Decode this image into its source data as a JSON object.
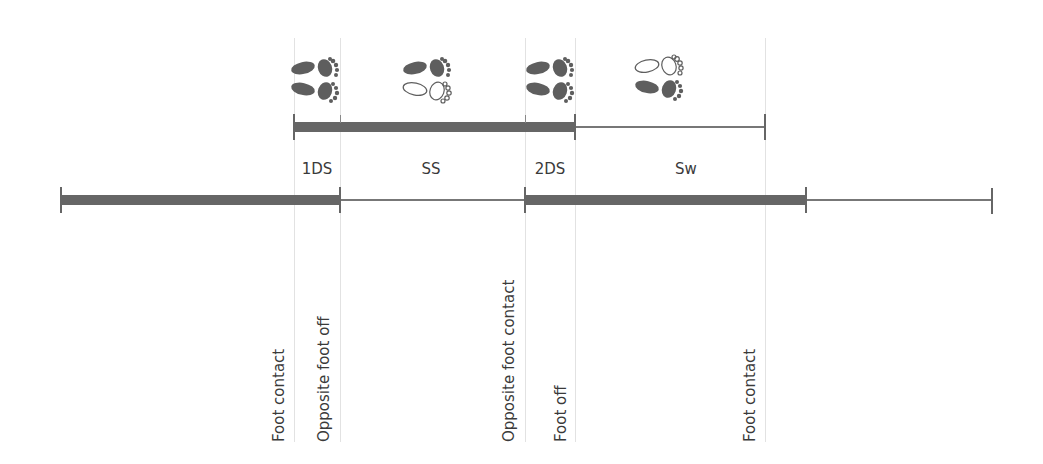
{
  "diagram": {
    "colors": {
      "bar_dark": "#666666",
      "bar_thin": "#777777",
      "guide": "#e2e2e2",
      "foot_filled": "#5e5e5e",
      "text": "#3a3a3a"
    },
    "phases": [
      {
        "id": "1ds",
        "label": "1DS",
        "feet": {
          "top": "filled",
          "bottom": "filled"
        }
      },
      {
        "id": "ss",
        "label": "SS",
        "feet": {
          "top": "filled",
          "bottom": "outline"
        }
      },
      {
        "id": "2ds",
        "label": "2DS",
        "feet": {
          "top": "filled",
          "bottom": "filled"
        }
      },
      {
        "id": "sw",
        "label": "Sw",
        "feet": {
          "top": "outline",
          "bottom": "filled"
        }
      }
    ],
    "events": [
      {
        "id": "foot-contact-1",
        "label": "Foot contact"
      },
      {
        "id": "opposite-foot-off",
        "label": "Opposite foot off"
      },
      {
        "id": "opposite-foot-contact",
        "label": "Opposite foot contact"
      },
      {
        "id": "foot-off",
        "label": "Foot off"
      },
      {
        "id": "foot-contact-2",
        "label": "Foot contact"
      }
    ],
    "icons": {
      "footprint_pair": "footprints-icon"
    }
  }
}
